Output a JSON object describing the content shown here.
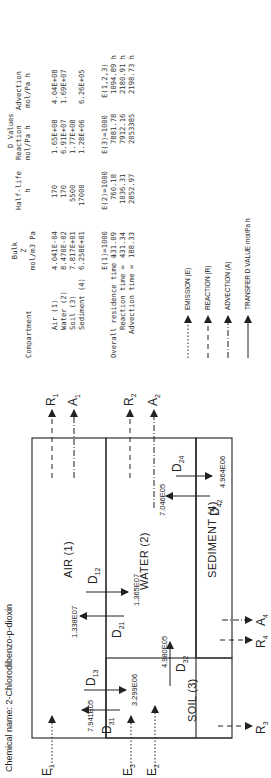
{
  "chemical": {
    "label": "Chemical name:",
    "name": "2-Chlorodibenzo-p-dioxin"
  },
  "table": {
    "headers": {
      "compartment": "Compartment",
      "bulk_z": [
        "Bulk",
        "Z",
        "mol/m3 Pa"
      ],
      "half_life": [
        "Half-life",
        "h"
      ],
      "d_values": "D Values",
      "reaction": [
        "Reaction",
        "mol/Pa h"
      ],
      "advection": [
        "Advection",
        "mol/Pa h"
      ]
    },
    "rows": [
      {
        "compartment": "Air (1)",
        "z": "4.041E-04",
        "half_life": "170",
        "reaction": "1.65E+08",
        "advection": "4.04E+08"
      },
      {
        "compartment": "Water (2)",
        "z": "8.470E-02",
        "half_life": "170",
        "reaction": "6.91E+07",
        "advection": "1.69E+07"
      },
      {
        "compartment": "Soil (3)",
        "z": "7.817E+01",
        "half_life": "5500",
        "reaction": "1.77E+08",
        "advection": ""
      },
      {
        "compartment": "Sediment (4)",
        "z": "6.258E+01",
        "half_life": "17000",
        "reaction": "1.28E+06",
        "advection": "6.26E+05"
      }
    ]
  },
  "times": {
    "columns": [
      "E(1)=1000",
      "E(2)=1000",
      "E(3)=1000",
      "E(1,2,3)"
    ],
    "rows": [
      {
        "label": "Overall residence time =",
        "values": [
          "131.09",
          "760.18",
          "7881.78",
          "1094.89 h"
        ]
      },
      {
        "label": "Reaction time =",
        "values": [
          "431.34",
          "1036.31",
          "7912.16",
          "2180.91 h"
        ]
      },
      {
        "label": "Advection time =",
        "values": [
          "188.33",
          "2852.97",
          "2053385",
          "2198.73 h"
        ]
      }
    ]
  },
  "legend": [
    {
      "style": "dotted",
      "label": "EMISSION (E)"
    },
    {
      "style": "dashed",
      "label": "REACTION (R)"
    },
    {
      "style": "dashdot",
      "label": "ADVECTION (A)"
    },
    {
      "style": "solid",
      "label": "TRANSFER D VALUE mol/Pa h"
    }
  ],
  "diagram": {
    "compartments": {
      "air": "AIR (1)",
      "water": "WATER (2)",
      "soil": "SOIL (3)",
      "sediment": "SEDIMENT (4)"
    },
    "transfers": {
      "D12": {
        "sym": "D",
        "sub": "12",
        "value": "1.365E07"
      },
      "D21": {
        "sym": "D",
        "sub": "21",
        "value": "1.338E07"
      },
      "D13": {
        "sym": "D",
        "sub": "13",
        "value": "3.299E06"
      },
      "D31": {
        "sym": "D",
        "sub": "31",
        "value": "7.941E05"
      },
      "D24": {
        "sym": "D",
        "sub": "24",
        "value": "4.964E06"
      },
      "D42": {
        "sym": "D",
        "sub": "42",
        "value": "7.046E05"
      },
      "D32": {
        "sym": "D",
        "sub": "32",
        "value": "4.980E05"
      }
    },
    "flows": {
      "E1": {
        "sym": "E",
        "sub": "1"
      },
      "E2": {
        "sym": "E",
        "sub": "2"
      },
      "E3": {
        "sym": "E",
        "sub": "3"
      },
      "R1": {
        "sym": "R",
        "sub": "1"
      },
      "A1": {
        "sym": "A",
        "sub": "1"
      },
      "R2": {
        "sym": "R",
        "sub": "2"
      },
      "A2": {
        "sym": "A",
        "sub": "2"
      },
      "R3": {
        "sym": "R",
        "sub": "3"
      },
      "R4": {
        "sym": "R",
        "sub": "4"
      },
      "A4": {
        "sym": "A",
        "sub": "4"
      }
    }
  }
}
